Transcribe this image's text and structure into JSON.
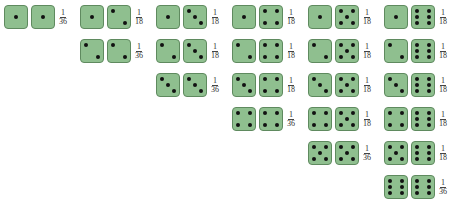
{
  "colors": {
    "die_fill": "#8fbf8f",
    "die_border": "#5f8a5f",
    "pip": "#111111"
  },
  "columns": [
    {
      "pairs": [
        {
          "dice": [
            1,
            1
          ],
          "num": "1",
          "den": "36"
        }
      ]
    },
    {
      "pairs": [
        {
          "dice": [
            1,
            2
          ],
          "num": "1",
          "den": "18"
        },
        {
          "dice": [
            2,
            2
          ],
          "num": "1",
          "den": "36"
        }
      ]
    },
    {
      "pairs": [
        {
          "dice": [
            1,
            3
          ],
          "num": "1",
          "den": "18"
        },
        {
          "dice": [
            2,
            3
          ],
          "num": "1",
          "den": "18"
        },
        {
          "dice": [
            3,
            3
          ],
          "num": "1",
          "den": "36"
        }
      ]
    },
    {
      "pairs": [
        {
          "dice": [
            1,
            4
          ],
          "num": "1",
          "den": "18"
        },
        {
          "dice": [
            2,
            4
          ],
          "num": "1",
          "den": "18"
        },
        {
          "dice": [
            3,
            4
          ],
          "num": "1",
          "den": "18"
        },
        {
          "dice": [
            4,
            4
          ],
          "num": "1",
          "den": "36"
        }
      ]
    },
    {
      "pairs": [
        {
          "dice": [
            1,
            5
          ],
          "num": "1",
          "den": "18"
        },
        {
          "dice": [
            2,
            5
          ],
          "num": "1",
          "den": "18"
        },
        {
          "dice": [
            3,
            5
          ],
          "num": "1",
          "den": "18"
        },
        {
          "dice": [
            4,
            5
          ],
          "num": "1",
          "den": "18"
        },
        {
          "dice": [
            5,
            5
          ],
          "num": "1",
          "den": "36"
        }
      ]
    },
    {
      "pairs": [
        {
          "dice": [
            1,
            6
          ],
          "num": "1",
          "den": "18"
        },
        {
          "dice": [
            2,
            6
          ],
          "num": "1",
          "den": "18"
        },
        {
          "dice": [
            3,
            6
          ],
          "num": "1",
          "den": "18"
        },
        {
          "dice": [
            4,
            6
          ],
          "num": "1",
          "den": "18"
        },
        {
          "dice": [
            5,
            6
          ],
          "num": "1",
          "den": "18"
        },
        {
          "dice": [
            6,
            6
          ],
          "num": "1",
          "den": "36"
        }
      ]
    }
  ]
}
